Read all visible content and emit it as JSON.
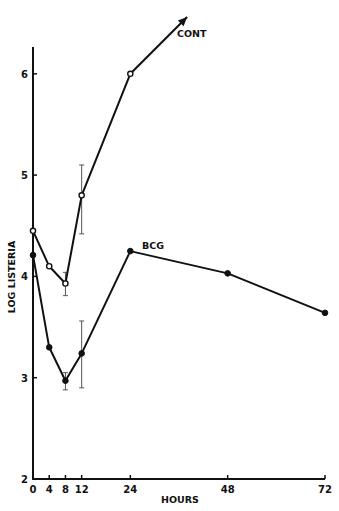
{
  "chart_data": {
    "type": "line",
    "title": "",
    "xlabel": "HOURS",
    "ylabel": "LOG LISTERIA",
    "xlim": [
      0,
      72
    ],
    "ylim": [
      2,
      6.5
    ],
    "x_ticks": [
      0,
      4,
      8,
      12,
      24,
      48,
      72
    ],
    "x_tick_labels": [
      "0",
      "4",
      "8",
      "12",
      "24",
      "48",
      "72"
    ],
    "y_ticks": [
      2,
      3,
      4,
      5,
      6
    ],
    "y_tick_labels": [
      "2",
      "3",
      "4",
      "5",
      "6"
    ],
    "grid": false,
    "series": [
      {
        "name": "CONT",
        "marker": "open-circle",
        "x": [
          0,
          4,
          8,
          12,
          24
        ],
        "values": [
          4.45,
          4.1,
          3.93,
          4.8,
          6.0
        ],
        "error_bars": [
          {
            "x": 8,
            "low": 3.81,
            "high": 4.04
          },
          {
            "x": 12,
            "low": 4.42,
            "high": 5.1
          }
        ],
        "trend_arrow_to": {
          "x": 38,
          "y": 6.56
        },
        "label": "CONT"
      },
      {
        "name": "BCG",
        "marker": "filled-circle",
        "x": [
          0,
          4,
          8,
          12,
          24,
          48,
          72
        ],
        "values": [
          4.21,
          3.3,
          2.97,
          3.24,
          4.25,
          4.03,
          3.64
        ],
        "error_bars": [
          {
            "x": 8,
            "low": 2.88,
            "high": 3.05
          },
          {
            "x": 12,
            "low": 2.9,
            "high": 3.56
          }
        ],
        "label": "BCG"
      }
    ]
  }
}
